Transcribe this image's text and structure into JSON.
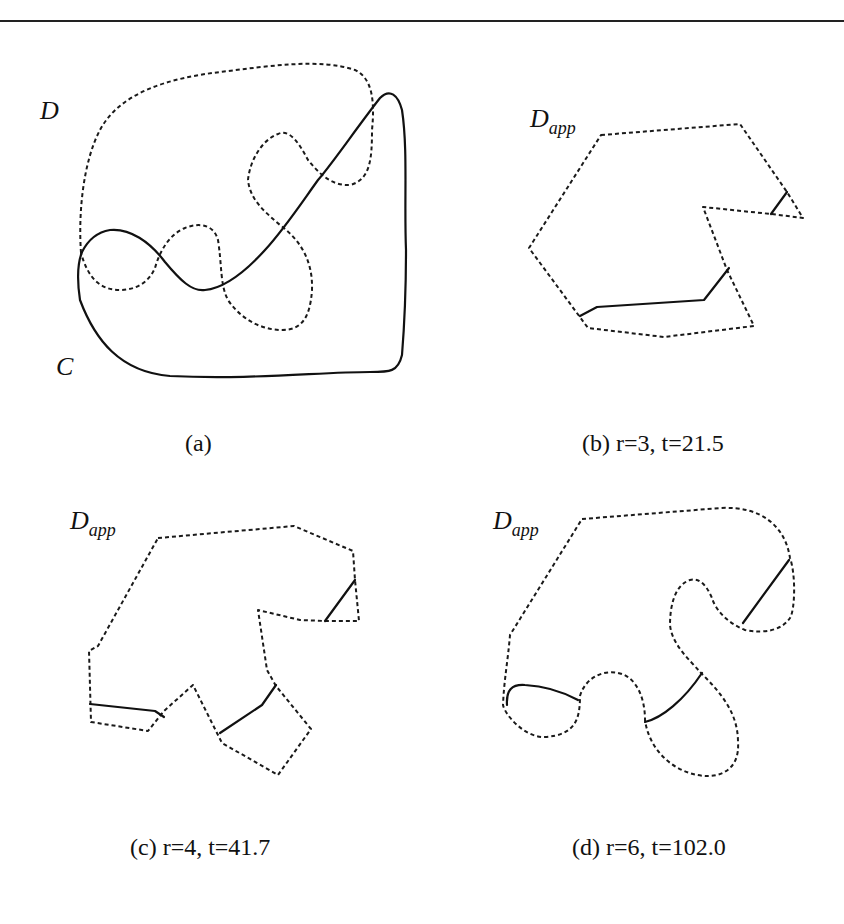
{
  "figure": {
    "panels": [
      {
        "id": "a",
        "caption": "(a)",
        "labels": {
          "region": "D",
          "curve": "C"
        }
      },
      {
        "id": "b",
        "caption": "(b) r=3, t=21.5",
        "label_main": "D",
        "label_sub": "app",
        "r": 3,
        "t": 21.5
      },
      {
        "id": "c",
        "caption": "(c) r=4, t=41.7",
        "label_main": "D",
        "label_sub": "app",
        "r": 4,
        "t": 41.7
      },
      {
        "id": "d",
        "caption": "(d) r=6, t=102.0",
        "label_main": "D",
        "label_sub": "app",
        "r": 6,
        "t": 102.0
      }
    ],
    "legend": {
      "dashed": "region boundary (D / D_app)",
      "solid": "curve C (clipped segments)"
    }
  }
}
